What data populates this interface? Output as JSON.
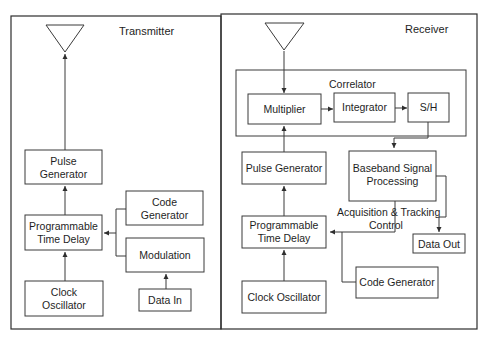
{
  "transmitter": {
    "title": "Transmitter",
    "blocks": {
      "pulse_generator": [
        "Pulse",
        "Generator"
      ],
      "programmable_time_delay": [
        "Programmable",
        "Time Delay"
      ],
      "clock_oscillator": [
        "Clock",
        "Oscillator"
      ],
      "code_generator": [
        "Code",
        "Generator"
      ],
      "modulation": [
        "Modulation"
      ],
      "data_in": [
        "Data In"
      ]
    }
  },
  "receiver": {
    "title": "Receiver",
    "correlator": {
      "title": "Correlator",
      "multiplier": "Multiplier",
      "integrator": "Integrator",
      "sample_hold": "S/H"
    },
    "blocks": {
      "pulse_generator": [
        "Pulse Generator"
      ],
      "baseband_signal_processing": [
        "Baseband Signal",
        "Processing"
      ],
      "acquisition_tracking_control": [
        "Acquisition & Tracking",
        "Control"
      ],
      "programmable_time_delay": [
        "Programmable",
        "Time Delay"
      ],
      "data_out": [
        "Data Out"
      ],
      "code_generator": [
        "Code Generator"
      ],
      "clock_oscillator": [
        "Clock Oscillator"
      ]
    }
  }
}
